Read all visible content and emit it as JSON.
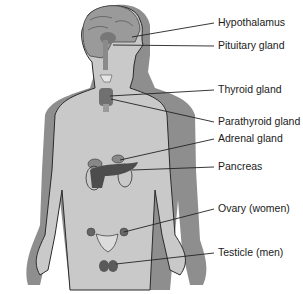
{
  "diagram": {
    "colors": {
      "body_fill": "#c9c9c9",
      "body_shadow": "#8e8e8e",
      "outline": "#2a2a2a",
      "organ_dark": "#555555",
      "leader_line": "#222222",
      "label_text": "#1a1a1a"
    },
    "labels": [
      {
        "id": "hypothalamus",
        "text": "Hypothalamus",
        "y": 22
      },
      {
        "id": "pituitary",
        "text": "Pituitary gland",
        "y": 45
      },
      {
        "id": "thyroid",
        "text": "Thyroid gland",
        "y": 89
      },
      {
        "id": "parathyroid",
        "text": "Parathyroid gland",
        "y": 121
      },
      {
        "id": "adrenal",
        "text": "Adrenal gland",
        "y": 138
      },
      {
        "id": "pancreas",
        "text": "Pancreas",
        "y": 166
      },
      {
        "id": "ovary",
        "text": "Ovary (women)",
        "y": 208
      },
      {
        "id": "testicle",
        "text": "Testicle (men)",
        "y": 252
      }
    ]
  }
}
